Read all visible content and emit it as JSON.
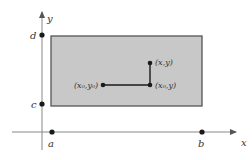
{
  "figure": {
    "colors": {
      "background": "#ffffff",
      "rect_fill": "#c8c8c8",
      "rect_stroke": "#555555",
      "axis": "#777777",
      "ink": "#1a1a1a",
      "label": "#333333"
    },
    "axes": {
      "x_label": "x",
      "y_label": "y"
    },
    "ticks": {
      "a": "a",
      "b": "b",
      "c": "c",
      "d": "d"
    },
    "points": {
      "p_xy": "(x,y)",
      "p_x0y": "(x₀,y)",
      "p_x0y0": "(x₀,y₀)"
    }
  }
}
